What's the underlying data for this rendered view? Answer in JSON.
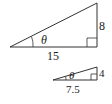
{
  "large_triangle": {
    "base": "15",
    "height": "8",
    "angle": "θ"
  },
  "small_triangle": {
    "base": "7.5",
    "height": "4",
    "angle": "θ"
  },
  "colors": {
    "stroke": "#333333",
    "text": "#222222"
  }
}
